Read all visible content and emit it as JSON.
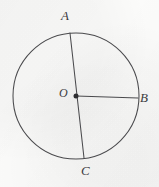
{
  "figure": {
    "kind": "circle-with-diameter-and-radius",
    "caption": "",
    "background_color": "#fbfbfa",
    "stroke_color": "#4a4a4d",
    "label_color": "#3b3b3e",
    "stroke_width": 1,
    "circle": {
      "center_x": 76,
      "center_y": 96,
      "radius": 63
    },
    "points": [
      {
        "id": "A",
        "label": "A",
        "x": 70,
        "y": 33,
        "role": "circle-point-diameter-end"
      },
      {
        "id": "B",
        "label": "B",
        "x": 138,
        "y": 98,
        "role": "circle-point-radius-end"
      },
      {
        "id": "C",
        "label": "C",
        "x": 84,
        "y": 158,
        "role": "circle-point-diameter-end"
      },
      {
        "id": "O",
        "label": "O",
        "x": 76,
        "y": 96,
        "role": "center"
      }
    ],
    "segments": [
      {
        "id": "AC",
        "label": "AC",
        "from": "A",
        "to": "C",
        "kind": "diameter"
      },
      {
        "id": "OB",
        "label": "OB",
        "from": "O",
        "to": "B",
        "kind": "radius"
      }
    ],
    "labels": {
      "A": "A",
      "B": "B",
      "C": "C",
      "O": "O"
    }
  }
}
